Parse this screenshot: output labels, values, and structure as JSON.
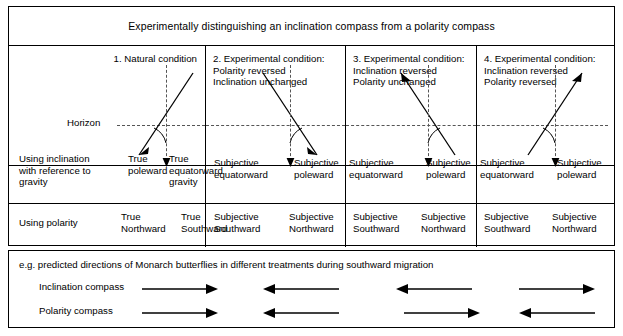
{
  "title": "Experimentally distinguishing an inclination compass from a polarity compass",
  "columns": [
    {
      "header": [
        "1. Natural condition"
      ],
      "align": "right",
      "field_arrow": "down-left",
      "left_label": [
        "True",
        "poleward"
      ],
      "right_label": [
        "True",
        "equatorward"
      ],
      "gravity_label": "gravity",
      "polarity_left": [
        "True",
        "Northward"
      ],
      "polarity_right": [
        "True",
        "Southward"
      ],
      "inclination_prediction": "right",
      "polarity_prediction": "right"
    },
    {
      "header": [
        "2. Experimental condition:",
        "Polarity reversed",
        "Inclination unchanged"
      ],
      "align": "left",
      "field_arrow": "down-right",
      "left_label": [
        "Subjective",
        "equatorward"
      ],
      "right_label": [
        "Subjective",
        "poleward"
      ],
      "gravity_label": "",
      "polarity_left": [
        "Subjective",
        "Southward"
      ],
      "polarity_right": [
        "Subjective",
        "Northward"
      ],
      "inclination_prediction": "left",
      "polarity_prediction": "left"
    },
    {
      "header": [
        "3. Experimental condition:",
        "Inclination reversed",
        "Polarity unchanged"
      ],
      "align": "left",
      "field_arrow": "up-left",
      "left_label": [
        "Subjective",
        "equatorward"
      ],
      "right_label": [
        "Subjective",
        "poleward"
      ],
      "gravity_label": "",
      "polarity_left": [
        "Subjective",
        "Southward"
      ],
      "polarity_right": [
        "Subjective",
        "Northward"
      ],
      "inclination_prediction": "left",
      "polarity_prediction": "right"
    },
    {
      "header": [
        "4. Experimental condition:",
        "Inclination reversed",
        "Polarity reversed"
      ],
      "align": "left",
      "field_arrow": "up-right",
      "left_label": [
        "Subjective",
        "equatorward"
      ],
      "right_label": [
        "Subjective",
        "poleward"
      ],
      "gravity_label": "",
      "polarity_left": [
        "Subjective",
        "Southward"
      ],
      "polarity_right": [
        "Subjective",
        "Northward"
      ],
      "inclination_prediction": "right",
      "polarity_prediction": "left"
    }
  ],
  "row_labels": {
    "inclination_row": [
      "Using inclination",
      "with reference to",
      "gravity"
    ],
    "polarity_row": "Using polarity",
    "horizon": "Horizon"
  },
  "bottom": {
    "caption": "e.g. predicted directions of Monarch butterflies in different treatments during southward migration",
    "inclination_label": "Inclination compass",
    "polarity_label": "Polarity compass"
  },
  "colors": {
    "line": "#000000",
    "dashed": "#555555",
    "background": "#ffffff"
  }
}
